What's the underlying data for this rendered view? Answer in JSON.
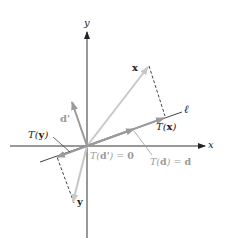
{
  "diagram": {
    "title": "",
    "colors": {
      "axis": "#333333",
      "vector_light": "#c8c8c8",
      "vector_mid": "#9a9a9a",
      "line_l": "#444444",
      "dashed": "#444444",
      "label_dark": "#222222",
      "label_light": "#9a9a9a"
    },
    "axes": {
      "x_label": "x",
      "y_label": "y"
    },
    "line": {
      "label": "ℓ"
    },
    "vectors": [
      {
        "name": "x",
        "label": "x"
      },
      {
        "name": "T(x)",
        "label_prefix": "T(",
        "label_var": "x",
        "label_suffix": ")"
      },
      {
        "name": "y",
        "label": "y"
      },
      {
        "name": "T(y)",
        "label_prefix": "T(",
        "label_var": "y",
        "label_suffix": ")"
      },
      {
        "name": "d'",
        "label": "d'"
      },
      {
        "name": "d",
        "label": "d"
      }
    ],
    "annotations": {
      "t_d_prime": {
        "prefix": "T(",
        "var": "d'",
        "suffix": ") = ",
        "value": "0"
      },
      "t_d": {
        "prefix": "T(",
        "var": "d",
        "suffix": ") = ",
        "value": "d"
      }
    }
  }
}
